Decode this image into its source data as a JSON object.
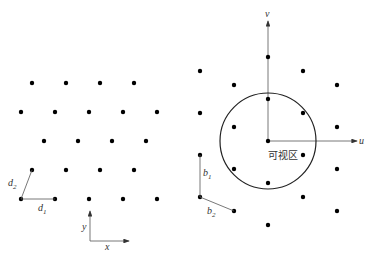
{
  "left_panel": {
    "dots": [
      [
        32,
        83
      ],
      [
        66,
        83
      ],
      [
        100,
        83
      ],
      [
        134,
        83
      ],
      [
        21,
        112
      ],
      [
        55,
        112
      ],
      [
        89,
        112
      ],
      [
        123,
        112
      ],
      [
        157,
        112
      ],
      [
        44,
        141
      ],
      [
        78,
        141
      ],
      [
        112,
        141
      ],
      [
        146,
        141
      ],
      [
        32,
        170
      ],
      [
        66,
        170
      ],
      [
        100,
        170
      ],
      [
        134,
        170
      ],
      [
        21,
        199
      ],
      [
        55,
        199
      ],
      [
        89,
        199
      ],
      [
        123,
        199
      ],
      [
        157,
        199
      ]
    ],
    "vector_d1": {
      "label": "d",
      "sub": "1"
    },
    "vector_d2": {
      "label": "d",
      "sub": "2"
    },
    "axis_x": "x",
    "axis_y": "y"
  },
  "right_panel": {
    "dots": [
      [
        268,
        57
      ],
      [
        200,
        71
      ],
      [
        303,
        71
      ],
      [
        234,
        85
      ],
      [
        337,
        85
      ],
      [
        268,
        99
      ],
      [
        200,
        113
      ],
      [
        303,
        113
      ],
      [
        234,
        127
      ],
      [
        337,
        127
      ],
      [
        268,
        141
      ],
      [
        200,
        155
      ],
      [
        303,
        155
      ],
      [
        234,
        169
      ],
      [
        337,
        169
      ],
      [
        268,
        183
      ],
      [
        200,
        197
      ],
      [
        303,
        197
      ],
      [
        234,
        211
      ],
      [
        337,
        211
      ],
      [
        268,
        225
      ]
    ],
    "circle": {
      "cx": 268,
      "cy": 141,
      "r": 48
    },
    "axis_u": "u",
    "axis_v": "v",
    "visible_region_label": "可视区",
    "vector_b1": {
      "label": "b",
      "sub": "1"
    },
    "vector_b2": {
      "label": "b",
      "sub": "2"
    }
  }
}
